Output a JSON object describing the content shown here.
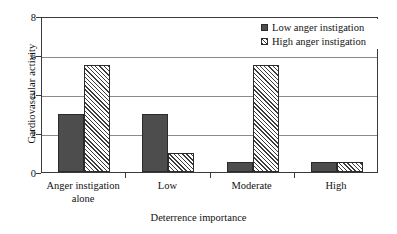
{
  "chart_data": {
    "type": "bar",
    "title": "",
    "xlabel": "Deterrence importance",
    "ylabel": "Cardiovascular activity",
    "categories": [
      "Anger instigation\nalone",
      "Low",
      "Moderate",
      "High"
    ],
    "category_lines": [
      [
        "Anger instigation",
        "alone"
      ],
      [
        "Low"
      ],
      [
        "Moderate"
      ],
      [
        "High"
      ]
    ],
    "series": [
      {
        "name": "Low anger instigation",
        "pattern": "solid",
        "color": "#4d4d4d",
        "values": [
          3,
          3,
          0.5,
          0.5
        ]
      },
      {
        "name": "High anger instigation",
        "pattern": "diagonal-hatch",
        "color": "#3c3c3c",
        "values": [
          5.5,
          1,
          5.5,
          0.5
        ]
      }
    ],
    "ylim": [
      0,
      8
    ],
    "yticks": [
      0,
      2,
      4,
      6,
      8
    ],
    "ytick_labels": [
      "0",
      "2",
      "4",
      "6",
      "8"
    ],
    "grid": true,
    "grid_axis": "y",
    "legend_position": "top-right"
  },
  "axes": {
    "y_title": "Cardiovascular activity",
    "x_title": "Deterrence importance"
  },
  "legend": {
    "entries": [
      {
        "label": "Low anger instigation",
        "swatch": "solid-dark-gray"
      },
      {
        "label": "High anger instigation",
        "swatch": "diagonal-hatch"
      }
    ]
  },
  "colors": {
    "series_low": "#4d4d4d",
    "series_high_hatch": "#3c3c3c",
    "grid": "#8a8a8a",
    "frame": "#3a3a3a",
    "background": "#ffffff",
    "text": "#111111"
  }
}
